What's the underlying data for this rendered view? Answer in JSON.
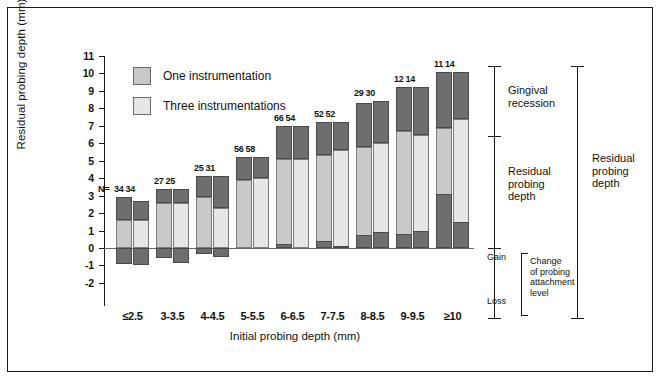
{
  "chart_data": {
    "type": "bar",
    "title": "",
    "xlabel": "Initial probing depth (mm)",
    "ylabel": "Residual probing depth (mm)",
    "ylim": [
      -2,
      11
    ],
    "yticks": [
      11,
      10,
      9,
      8,
      7,
      6,
      5,
      4,
      3,
      2,
      1,
      0,
      -1,
      -2
    ],
    "grid": false,
    "legend_position": "upper-left",
    "legend": [
      {
        "name": "One instrumentation",
        "color": "#c9c9c9"
      },
      {
        "name": "Three instrumentations",
        "color": "#e6e6e6"
      }
    ],
    "stack_key": [
      {
        "name": "Gingival recession",
        "color": "#6e6e6e"
      },
      {
        "name": "Residual probing depth",
        "color": "#c9c9c9"
      },
      {
        "name": "Change of probing attachment level",
        "color": "#6e6e6e"
      }
    ],
    "categories": [
      "≤2.5",
      "3-3.5",
      "4-4.5",
      "5-5.5",
      "6-6.5",
      "7-7.5",
      "8-8.5",
      "9-9.5",
      "≥10"
    ],
    "n_prefix": "N=",
    "series": [
      {
        "name": "One instrumentation",
        "n": [
          34,
          27,
          25,
          56,
          66,
          52,
          29,
          12,
          11
        ],
        "residual_probing_depth": [
          1.6,
          2.6,
          2.9,
          3.9,
          5.1,
          5.3,
          5.8,
          6.7,
          6.9
        ],
        "gingival_recession": [
          1.3,
          0.8,
          1.2,
          1.3,
          1.9,
          1.9,
          2.5,
          2.5,
          3.2
        ],
        "attachment_change": [
          -0.9,
          -0.6,
          -0.35,
          0.0,
          0.25,
          0.4,
          0.75,
          0.8,
          3.1
        ],
        "total_top": [
          2.9,
          3.4,
          4.1,
          5.2,
          7.0,
          7.2,
          8.3,
          9.2,
          10.1
        ]
      },
      {
        "name": "Three instrumentations",
        "n": [
          34,
          25,
          31,
          58,
          54,
          52,
          30,
          14,
          14
        ],
        "residual_probing_depth": [
          1.6,
          2.6,
          2.3,
          4.0,
          5.1,
          5.6,
          6.0,
          6.5,
          7.4
        ],
        "gingival_recession": [
          1.1,
          0.8,
          1.8,
          1.2,
          1.9,
          1.6,
          2.4,
          2.7,
          2.7
        ],
        "attachment_change": [
          -0.95,
          -0.85,
          -0.5,
          0.0,
          0.0,
          0.1,
          0.9,
          0.95,
          1.5
        ],
        "total_top": [
          2.7,
          3.4,
          4.1,
          5.2,
          7.0,
          7.2,
          8.4,
          9.2,
          10.1
        ]
      }
    ],
    "annotations": [
      {
        "label": "Gingival\nrecession"
      },
      {
        "label": "Residual\nprobing\ndepth"
      },
      {
        "label": "Gain"
      },
      {
        "label": "Loss"
      },
      {
        "label": "Change\nof probing\nattachment\nlevel"
      },
      {
        "label": "Residual\nprobing\ndepth"
      }
    ]
  },
  "axis": {
    "y_label": "Residual probing depth (mm)",
    "x_label": "Initial probing depth (mm)",
    "y_ticks": [
      "11",
      "10",
      "9",
      "8",
      "7",
      "6",
      "5",
      "4",
      "3",
      "2",
      "1",
      "0",
      "-1",
      "-2"
    ],
    "x_ticks": [
      "≤2.5",
      "3-3.5",
      "4-4.5",
      "5-5.5",
      "6-6.5",
      "7-7.5",
      "8-8.5",
      "9-9.5",
      "≥10"
    ]
  },
  "legend": {
    "item_one": "One instrumentation",
    "item_three": "Three instrumentations"
  },
  "n_values": {
    "prefix": "N=",
    "rows": [
      "34  34",
      "27  25",
      "25  31",
      "56  58",
      "66  54",
      "52  52",
      "29  30",
      "12  14",
      "11  14"
    ]
  },
  "annotations": {
    "gingival_recession": "Gingival\nrecession",
    "residual_probing_depth_inner": "Residual\nprobing\ndepth",
    "gain": "Gain",
    "loss": "Loss",
    "change_attachment": "Change\nof probing\nattachment\nlevel",
    "residual_probing_depth_outer": "Residual\nprobing\ndepth"
  },
  "colors": {
    "recession": "#6e6e6e",
    "one_instrumentation": "#c9c9c9",
    "three_instrumentations": "#e6e6e6",
    "axis": "#1a1a1a",
    "zero_line": "#6b6b6b"
  }
}
